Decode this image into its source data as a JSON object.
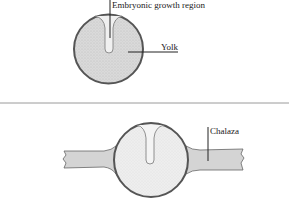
{
  "diagram": {
    "top_panel": {
      "labels": {
        "embryonic": "Embryonic growth region",
        "yolk": "Yolk"
      }
    },
    "bottom_panel": {
      "labels": {
        "chalaza": "Chalaza"
      }
    },
    "colors": {
      "outline": "#555555",
      "yolk_fill": "#d9d9d9",
      "bottom_yolk_fill": "#ececec",
      "chalaza_fill": "#d4d4d4",
      "embryo_fill": "#f2f2f2",
      "separator": "#9a9a9a",
      "leader": "#222222"
    }
  }
}
